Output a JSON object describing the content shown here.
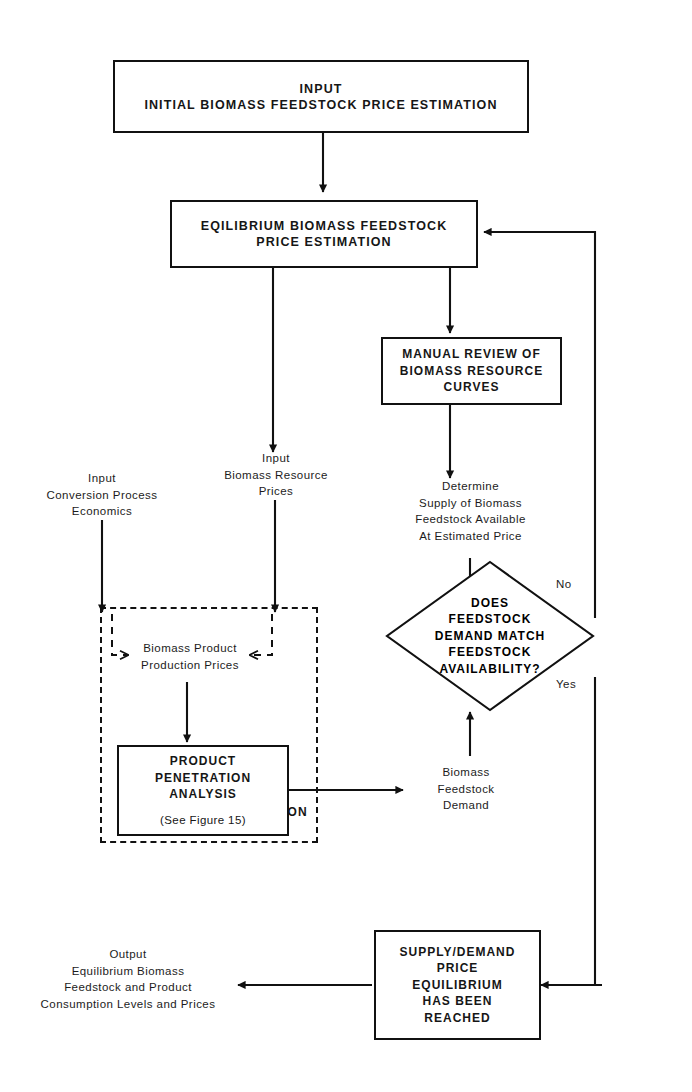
{
  "figure": {
    "type": "flowchart"
  },
  "nodes": {
    "input_initial": {
      "lines": [
        "INPUT",
        "INITIAL BIOMASS FEEDSTOCK PRICE ESTIMATION"
      ]
    },
    "equilibrium_estimation": {
      "lines": [
        "EQILIBRIUM BIOMASS FEEDSTOCK",
        "PRICE ESTIMATION"
      ]
    },
    "manual_review": {
      "lines": [
        "MANUAL REVIEW OF",
        "BIOMASS RESOURCE",
        "CURVES"
      ]
    },
    "determine_supply": {
      "lines": [
        "Determine",
        "Supply of Biomass",
        "Feedstock Available",
        "At Estimated Price"
      ]
    },
    "decision": {
      "lines": [
        "DOES",
        "FEEDSTOCK",
        "DEMAND MATCH",
        "FEEDSTOCK",
        "AVAILABILITY?"
      ],
      "branch_no": "No",
      "branch_yes": "Yes"
    },
    "input_conversion": {
      "lines": [
        "Input",
        "Conversion Process",
        "Economics"
      ]
    },
    "input_biomass_prices": {
      "lines": [
        "Input",
        "Biomass Resource",
        "Prices"
      ]
    },
    "biomass_product_prices": {
      "lines": [
        "Biomass Product",
        "Production Prices"
      ]
    },
    "product_penetration": {
      "lines": [
        "PRODUCT",
        "PENETRATION",
        "ANALYSIS"
      ],
      "note": "(See Figure 15)"
    },
    "computer_computation": {
      "caption": "COMPUTER COMPUTATION"
    },
    "biomass_feedstock_demand": {
      "lines": [
        "Biomass",
        "Feedstock",
        "Demand"
      ]
    },
    "supply_demand_equilibrium": {
      "lines": [
        "SUPPLY/DEMAND",
        "PRICE",
        "EQUILIBRIUM",
        "HAS BEEN",
        "REACHED"
      ]
    },
    "output_equilibrium": {
      "lines": [
        "Output",
        "Equilibrium Biomass",
        "Feedstock and Product",
        "Consumption Levels and Prices"
      ]
    }
  },
  "colors": {
    "ink": "#111111",
    "text": "#1c1c1c",
    "paper": "#ffffff"
  }
}
